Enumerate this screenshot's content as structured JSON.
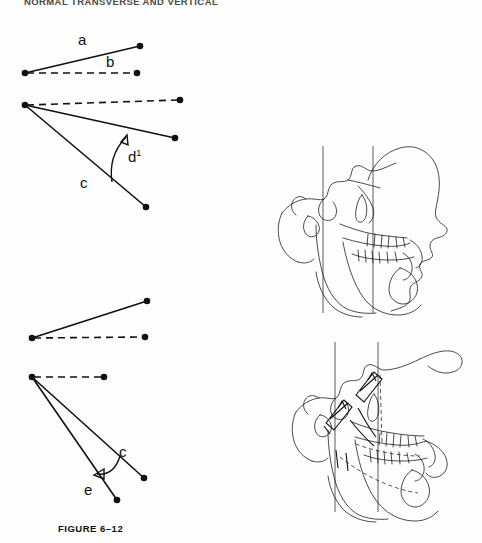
{
  "page": {
    "running_head": "NORMAL TRANSVERSE AND VERTICAL"
  },
  "figures": [
    {
      "id": "figure-6-12",
      "caption": "FIGURE 6–12",
      "description": "Line diagrams of angular relationships",
      "diagrams": [
        {
          "id": "diagram-1",
          "labels": [
            {
              "name": "label-a",
              "text": "a",
              "x": 78,
              "y": 41
            },
            {
              "name": "label-b",
              "text": "b",
              "x": 106,
              "y": 65
            }
          ],
          "solid_segments": [
            {
              "x1": 25,
              "y1": 73,
              "x2": 140,
              "y2": 46
            }
          ],
          "dashed_segments": [
            {
              "x1": 25,
              "y1": 73,
              "x2": 137,
              "y2": 73
            }
          ],
          "nodes": [
            {
              "x": 25,
              "y": 73
            },
            {
              "x": 140,
              "y": 46
            },
            {
              "x": 137,
              "y": 73
            }
          ]
        },
        {
          "id": "diagram-2",
          "labels": [
            {
              "name": "label-c",
              "text": "c",
              "x": 85,
              "y": 181
            },
            {
              "name": "label-d-prime",
              "text": "d",
              "sup": "1",
              "x": 133,
              "y": 153
            }
          ],
          "solid_segments": [
            {
              "x1": 25,
              "y1": 104,
              "x2": 175,
              "y2": 137
            },
            {
              "x1": 25,
              "y1": 104,
              "x2": 146,
              "y2": 206
            }
          ],
          "dashed_segments": [
            {
              "x1": 25,
              "y1": 104,
              "x2": 180,
              "y2": 99
            }
          ],
          "nodes": [
            {
              "x": 25,
              "y": 104
            },
            {
              "x": 180,
              "y": 99
            },
            {
              "x": 175,
              "y": 137
            },
            {
              "x": 146,
              "y": 206
            }
          ],
          "arc": {
            "from_x": 112,
            "from_y": 181,
            "to_x": 126,
            "to_y": 134
          }
        },
        {
          "id": "diagram-3",
          "labels": [],
          "solid_segments": [
            {
              "x1": 32,
              "y1": 338,
              "x2": 147,
              "y2": 301
            }
          ],
          "dashed_segments": [
            {
              "x1": 32,
              "y1": 338,
              "x2": 145,
              "y2": 337
            }
          ],
          "nodes": [
            {
              "x": 32,
              "y": 338
            },
            {
              "x": 147,
              "y": 301
            },
            {
              "x": 145,
              "y": 337
            }
          ]
        },
        {
          "id": "diagram-4",
          "labels": [
            {
              "name": "label-c2",
              "text": "c",
              "x": 123,
              "y": 452
            },
            {
              "name": "label-e",
              "text": "e",
              "x": 88,
              "y": 489
            }
          ],
          "solid_segments": [
            {
              "x1": 32,
              "y1": 377,
              "x2": 144,
              "y2": 478
            },
            {
              "x1": 32,
              "y1": 377,
              "x2": 117,
              "y2": 500
            }
          ],
          "dashed_segments": [
            {
              "x1": 32,
              "y1": 377,
              "x2": 104,
              "y2": 377
            }
          ],
          "nodes": [
            {
              "x": 32,
              "y": 377
            },
            {
              "x": 104,
              "y": 377
            },
            {
              "x": 144,
              "y": 478
            },
            {
              "x": 117,
              "y": 500
            }
          ],
          "arc": {
            "from_x": 120,
            "from_y": 456,
            "to_x": 97,
            "to_y": 474
          }
        }
      ]
    },
    {
      "id": "figure-6-13",
      "caption": "FIGURE 6–13",
      "description": "Lateral cephalometric tracings with vertical reference lines",
      "tracings": [
        {
          "id": "tracing-upper",
          "label": "cephalometric-tracing-upper",
          "reference_lines": 2
        },
        {
          "id": "tracing-lower",
          "label": "cephalometric-tracing-lower",
          "reference_lines": 2,
          "has_measurement_marks": true
        }
      ]
    }
  ],
  "colors": {
    "ink": "#111111",
    "trace_ink": "#1d1d1d",
    "paper": "#fefefe"
  }
}
